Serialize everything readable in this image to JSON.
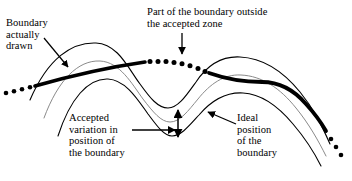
{
  "figure": {
    "type": "diagram",
    "background_color": "#ffffff",
    "width": 352,
    "height": 181
  },
  "labels": {
    "boundary_drawn": "Boundary\nactually\ndrawn",
    "outside_zone": "Part of the boundary outside\nthe accepted zone",
    "accepted_variation": "Accepted\nvariation in\nposition of\nthe boundary",
    "ideal_position": "Ideal\nposition\nof the\nboundary"
  },
  "elements": {
    "upper_tolerance_curve": "upper-tolerance-boundary",
    "lower_tolerance_curve": "lower-tolerance-boundary",
    "ideal_curve": "ideal-boundary-centerline",
    "drawn_curve_solid": "drawn-boundary-inside-zone",
    "drawn_curve_dotted": "drawn-boundary-outside-zone",
    "left_tail_dots": "drawn-boundary-left-tail",
    "right_tail_dots": "drawn-boundary-right-tail",
    "variation_arrow_vertical": "accepted-variation-extent-arrow",
    "variation_arrow_horizontal": "accepted-variation-leader",
    "outside_zone_arrow": "outside-zone-leader",
    "ideal_position_arrow": "ideal-position-leader",
    "boundary_drawn_arrow": "boundary-drawn-leader"
  },
  "colors": {
    "stroke": "#000000",
    "ideal_stroke": "#808080",
    "background": "#ffffff"
  }
}
